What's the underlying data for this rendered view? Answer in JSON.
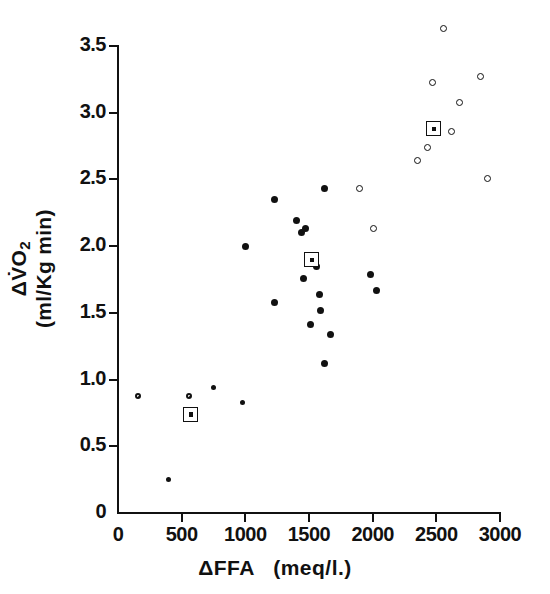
{
  "chart_data": {
    "type": "scatter",
    "title": "",
    "xlabel": "ΔFFA (meq/l.)",
    "ylabel": "ΔV̇O2 (ml/Kg min)",
    "ylabel_line1": "ΔV̇O",
    "ylabel_line1_sub": "2",
    "ylabel_line2": "(ml/Kg min)",
    "xlabel_prefix": "ΔFFA",
    "xlabel_units": "(meq/l.)",
    "xlim": [
      0,
      3000
    ],
    "ylim": [
      0,
      3.5
    ],
    "xticks": [
      "0",
      "500",
      "1000",
      "1500",
      "2000",
      "2500",
      "3000"
    ],
    "xtick_values": [
      0,
      500,
      1000,
      1500,
      2000,
      2500,
      3000
    ],
    "yticks": [
      "0",
      "0.5",
      "1.0",
      "1.5",
      "2.0",
      "2.5",
      "3.0",
      "3.5"
    ],
    "ytick_values": [
      0,
      0.5,
      1.0,
      1.5,
      2.0,
      2.5,
      3.0,
      3.5
    ],
    "grid": false,
    "legend": "none",
    "marker_color": "#111111",
    "background_color": "#ffffff",
    "series": [
      {
        "name": "filled-circles",
        "marker": "filled",
        "points": [
          [
            400,
            0.25
          ],
          [
            750,
            0.94
          ],
          [
            980,
            0.83
          ],
          [
            1000,
            2.0
          ],
          [
            1230,
            2.35
          ],
          [
            1230,
            1.58
          ],
          [
            1400,
            2.19
          ],
          [
            1440,
            2.1
          ],
          [
            1470,
            2.13
          ],
          [
            1460,
            1.76
          ],
          [
            1560,
            1.85
          ],
          [
            1580,
            1.64
          ],
          [
            1590,
            1.52
          ],
          [
            1620,
            2.43
          ],
          [
            1620,
            1.12
          ],
          [
            1510,
            1.41
          ],
          [
            1670,
            1.34
          ],
          [
            1980,
            1.79
          ],
          [
            2030,
            1.67
          ]
        ]
      },
      {
        "name": "open-circles",
        "marker": "open",
        "points": [
          [
            155,
            0.88
          ],
          [
            560,
            0.88
          ],
          [
            1900,
            2.43
          ],
          [
            2010,
            2.13
          ],
          [
            2350,
            2.64
          ],
          [
            2430,
            2.74
          ],
          [
            2470,
            3.23
          ],
          [
            2560,
            3.63
          ],
          [
            2620,
            2.86
          ],
          [
            2680,
            3.08
          ],
          [
            2850,
            3.27
          ],
          [
            2900,
            2.51
          ]
        ]
      },
      {
        "name": "group-means",
        "marker": "boxed",
        "points": [
          [
            570,
            0.74
          ],
          [
            1520,
            1.9
          ],
          [
            2480,
            2.88
          ]
        ]
      }
    ]
  }
}
